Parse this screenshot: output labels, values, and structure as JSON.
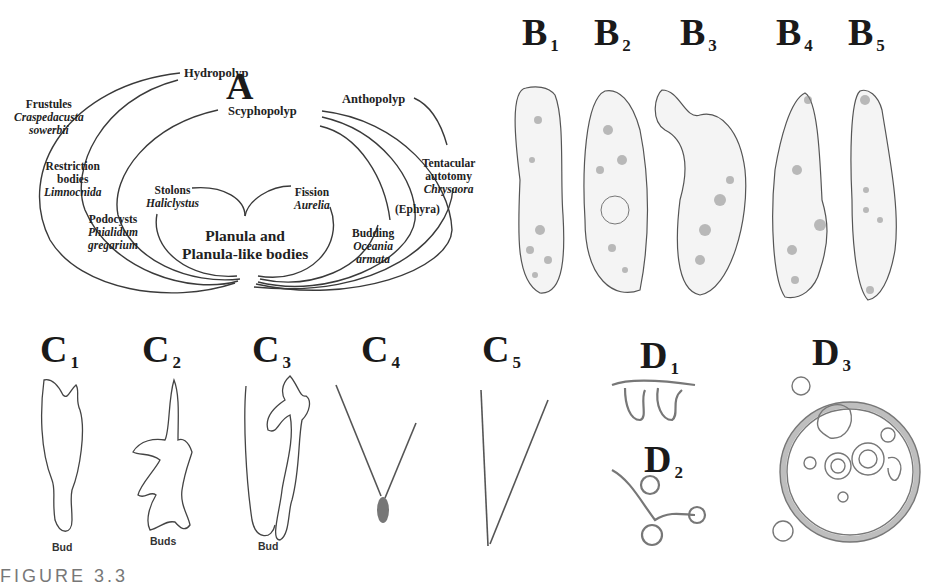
{
  "panels": {
    "A": {
      "label": "A"
    },
    "B": [
      {
        "label": "B",
        "sub": "1"
      },
      {
        "label": "B",
        "sub": "2"
      },
      {
        "label": "B",
        "sub": "3"
      },
      {
        "label": "B",
        "sub": "4"
      },
      {
        "label": "B",
        "sub": "5"
      }
    ],
    "C": [
      {
        "label": "C",
        "sub": "1"
      },
      {
        "label": "C",
        "sub": "2"
      },
      {
        "label": "C",
        "sub": "3"
      },
      {
        "label": "C",
        "sub": "4"
      },
      {
        "label": "C",
        "sub": "5"
      }
    ],
    "D": [
      {
        "label": "D",
        "sub": "1"
      },
      {
        "label": "D",
        "sub": "2"
      },
      {
        "label": "D",
        "sub": "3"
      }
    ]
  },
  "diagram_a": {
    "center": {
      "line1": "Planula and",
      "line2": "Planula-like bodies"
    },
    "polyps": {
      "hydro": "Hydropolyp",
      "scypho": "Scyphopolyp",
      "antho": "Anthopolyp"
    },
    "nodes": [
      {
        "title": "Frustules",
        "species": [
          "Craspedacusta",
          "sowerbii"
        ]
      },
      {
        "title": "Restriction bodies",
        "title_lines": [
          "Restriction",
          "bodies"
        ],
        "species": [
          "Limnocnida"
        ]
      },
      {
        "title": "Podocysts",
        "species": [
          "Phialidum",
          "gregarium"
        ]
      },
      {
        "title": "Stolons",
        "species": [
          "Haliclystus"
        ]
      },
      {
        "title": "Fission",
        "species": [
          "Aurelia"
        ]
      },
      {
        "title": "Budding",
        "species": [
          "Oceania",
          "armata"
        ]
      },
      {
        "title": "(Ephyra)",
        "species": []
      },
      {
        "title": "Tentacular autotomy",
        "title_lines": [
          "Tentacular",
          "autotomy"
        ],
        "species": [
          "Chrysaora"
        ]
      }
    ]
  },
  "captions": {
    "c1": "Bud",
    "c2": "Buds",
    "c3": "Bud"
  },
  "figure_caption": "FIGURE 3.3"
}
